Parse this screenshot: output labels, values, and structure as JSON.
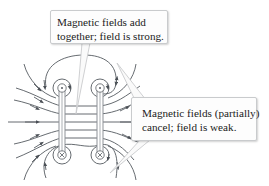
{
  "diagram": {
    "callouts": {
      "strong": {
        "lines": [
          "Magnetic fields add",
          "together; field is strong."
        ]
      },
      "weak": {
        "lines": [
          "Magnetic fields (partially)",
          "cancel; field is weak."
        ]
      }
    },
    "wires": [
      {
        "position": "left",
        "top_symbol": "dot",
        "bottom_symbol": "cross"
      },
      {
        "position": "right",
        "top_symbol": "dot",
        "bottom_symbol": "cross"
      }
    ],
    "colors": {
      "field_line": "#555a60",
      "wire": "#9a9ea3",
      "callout_border": "#c9cbcd",
      "pointer": "#c9cbcd"
    }
  }
}
